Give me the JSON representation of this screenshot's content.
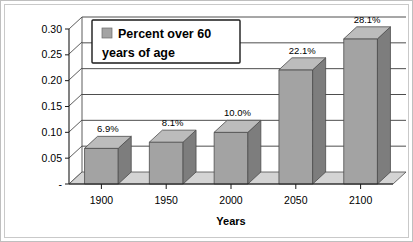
{
  "chart_data": {
    "type": "bar",
    "title": "",
    "subtitle": "",
    "xlabel": "Years",
    "ylabel": "",
    "categories": [
      "1900",
      "1950",
      "2000",
      "2050",
      "2100"
    ],
    "values": [
      0.069,
      0.081,
      0.1,
      0.221,
      0.281
    ],
    "data_labels": [
      "6.9%",
      "8.1%",
      "10.0%",
      "22.1%",
      "28.1%"
    ],
    "series": [
      {
        "name": "Percent over 60 years of age",
        "values": [
          0.069,
          0.081,
          0.1,
          0.221,
          0.281
        ],
        "color": "#a3a3a3"
      }
    ],
    "ylim": [
      0,
      0.3
    ],
    "ytick_labels": [
      "-",
      "0.05",
      "0.10",
      "0.15",
      "0.20",
      "0.25",
      "0.30"
    ],
    "ytick_values": [
      0,
      0.05,
      0.1,
      0.15,
      0.2,
      0.25,
      0.3
    ],
    "grid": true,
    "legend_position": "top-left",
    "style": "3d-column",
    "colors": {
      "bar_front": "#a3a3a3",
      "bar_side": "#7d7d7d",
      "bar_top": "#bcbcbc",
      "floor": "#d4d4d4",
      "grid": "#3a3a3a",
      "axis": "#1a1a1a",
      "background": "#ffffff",
      "border": "#bfbfbf"
    }
  },
  "legend": {
    "line1": "Percent over 60",
    "line2": "years of age",
    "swatch_color": "#a3a3a3"
  },
  "axis": {
    "x_title": "Years",
    "y_zero_label": "-"
  }
}
